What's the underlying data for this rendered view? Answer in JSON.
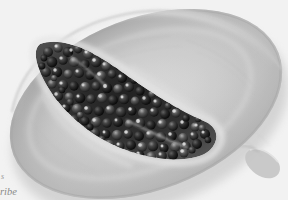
{
  "image": {
    "subject": "halved papaya fruit with seed cavity",
    "rendering": "grayscale photograph",
    "background_color": "#ffffff",
    "width": 288,
    "height": 200,
    "alt_text": "Black and white photograph of a papaya cut in half lengthwise, showing pale flesh and a dense cluster of dark round seeds in the central cavity"
  },
  "fruit": {
    "name": "papaya-half",
    "flesh_light": "#e4e4e4",
    "flesh_mid": "#c9c9c9",
    "flesh_shadow": "#9e9e9e",
    "rim_highlight": "#f4f4f4",
    "outline": "#b4b4b4",
    "rotation_degrees": -21,
    "center_x": 146,
    "center_y": 104,
    "radius_x": 142,
    "radius_y": 86,
    "stem_label": "stem-nub",
    "stem_x": 266,
    "stem_y": 166
  },
  "cavity": {
    "name": "seed-cavity",
    "fill_dark": "#2d2d2d",
    "fill_mid": "#4a4a4a",
    "wall_light": "#efefef",
    "start_x": 36,
    "start_y": 40,
    "end_x": 216,
    "end_y": 160
  },
  "seeds": {
    "name": "papaya-seeds",
    "count_visible": 168,
    "color_dark": "#1c1c1c",
    "color_body": "#3a3a3a",
    "color_highlight": "#e8e8e8",
    "shape": "round",
    "radius_min": 2.4,
    "radius_max": 6.2
  },
  "caption": {
    "name": "figure-caption",
    "clipped_at_left_margin": true,
    "line1": "s",
    "line2": "ribe",
    "style": "italic serif",
    "color": "#8e8e8e"
  }
}
